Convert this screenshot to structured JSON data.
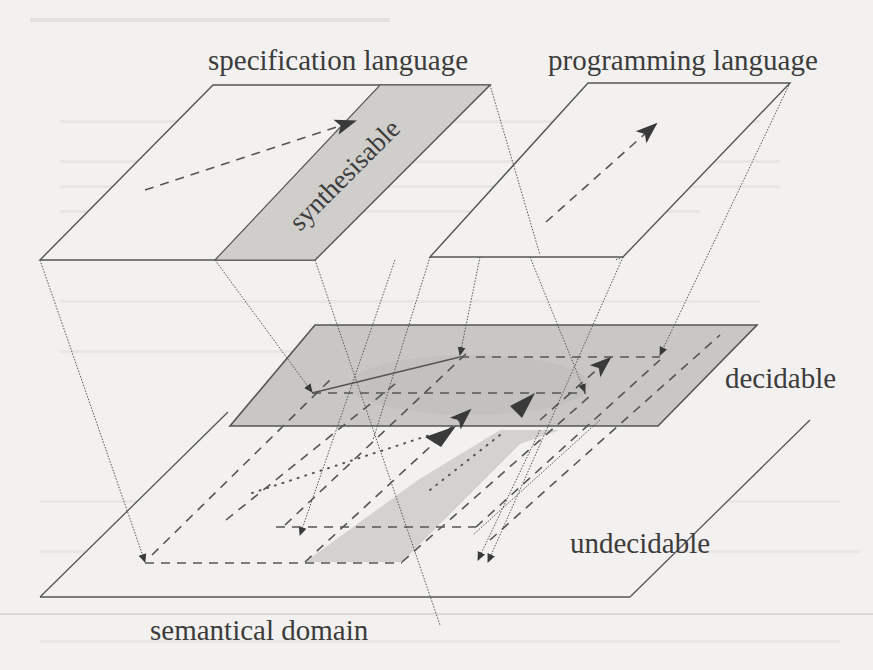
{
  "diagram": {
    "planes": {
      "specification": {
        "label": "specification language"
      },
      "programming": {
        "label": "programming language"
      },
      "decidable": {
        "label": "decidable"
      },
      "semantical": {
        "label": "semantical domain"
      },
      "undecidable": {
        "label": "undecidable"
      }
    },
    "regions": {
      "synthesisable": {
        "label": "synthesisable"
      }
    },
    "colors": {
      "background": "#f2f1ef",
      "line": "#555555",
      "shade": "#c9c7c4",
      "shade_dark": "#bdbbb8",
      "arrow": "#3a3a3a"
    }
  }
}
